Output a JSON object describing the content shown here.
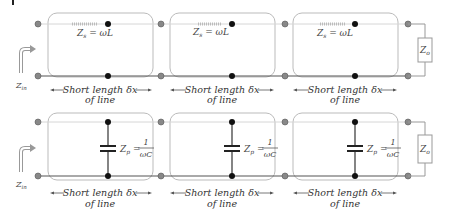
{
  "diagram": {
    "title_mark": "|",
    "top": {
      "input_label": "Z",
      "input_sub": "in",
      "sections": [
        {
          "series_label": "Z",
          "series_sub": "s",
          "series_eq": " = ωL",
          "dim_line1": "Short length δx",
          "dim_line2": "of line"
        },
        {
          "series_label": "Z",
          "series_sub": "s",
          "series_eq": " = ωL",
          "dim_line1": "Short length δx",
          "dim_line2": "of line"
        },
        {
          "series_label": "Z",
          "series_sub": "s",
          "series_eq": " = ωL",
          "dim_line1": "Short length δx",
          "dim_line2": "of line"
        }
      ],
      "load_label": "Z",
      "load_sub": "o"
    },
    "bottom": {
      "input_label": "Z",
      "input_sub": "in",
      "sections": [
        {
          "shunt_label": "Z",
          "shunt_sub": "p",
          "shunt_num": "1",
          "shunt_den": "ωC",
          "dim_line1": "Short length δx",
          "dim_line2": "of line"
        },
        {
          "shunt_label": "Z",
          "shunt_sub": "p",
          "shunt_num": "1",
          "shunt_den": "ωC",
          "dim_line1": "Short length δx",
          "dim_line2": "of line"
        },
        {
          "shunt_label": "Z",
          "shunt_sub": "p",
          "shunt_num": "1",
          "shunt_den": "ωC",
          "dim_line1": "Short length δx",
          "dim_line2": "of line"
        }
      ],
      "load_label": "Z",
      "load_sub": "o"
    },
    "colors": {
      "wire_top": "#d9d9d9",
      "wire_bottom": "#555555",
      "box_border": "#b8b8b8",
      "node_gray": "#8a8a8a",
      "node_black": "#111111",
      "arrow": "#999999"
    }
  }
}
